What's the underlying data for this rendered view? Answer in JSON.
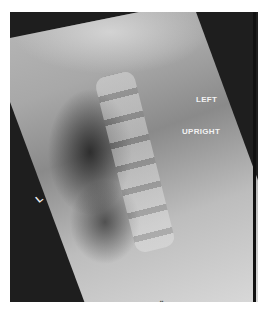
{
  "image": {
    "description": "Lateral cervical spine radiograph (upright)",
    "labels": {
      "side": "LEFT",
      "position": "UPRIGHT",
      "marker": "L"
    },
    "bottom_text": "▪▪"
  }
}
